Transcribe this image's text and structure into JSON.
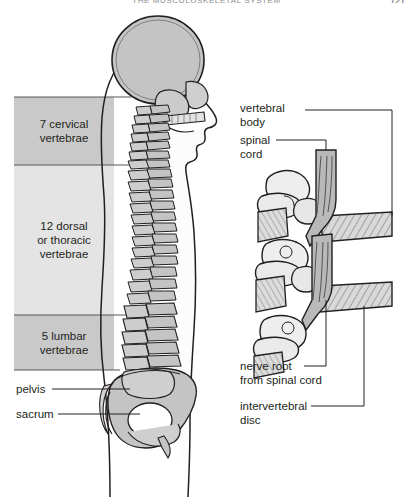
{
  "page": {
    "running_head": "THE MUSCULOSKELETAL SYSTEM",
    "folio": "121"
  },
  "figure": {
    "left_panel": {
      "name": "whole-spine-lateral",
      "regions": [
        {
          "id": "cervical",
          "label_line1": "7 cervical",
          "label_line2": "vertebrae",
          "fill": "#c9c9c9"
        },
        {
          "id": "thoracic",
          "label_line1": "12 dorsal",
          "label_line2": "or thoracic",
          "label_line3": "vertebrae",
          "fill": "#e4e4e4"
        },
        {
          "id": "lumbar",
          "label_line1": "5 lumbar",
          "label_line2": "vertebrae",
          "fill": "#c9c9c9"
        }
      ],
      "callouts": [
        {
          "id": "pelvis",
          "label": "pelvis"
        },
        {
          "id": "sacrum",
          "label": "sacrum"
        }
      ]
    },
    "right_panel": {
      "name": "vertebrae-detail",
      "callouts": [
        {
          "id": "vertebral-body",
          "line1": "vertebral",
          "line2": "body"
        },
        {
          "id": "spinal-cord",
          "line1": "spinal",
          "line2": "cord"
        },
        {
          "id": "nerve-root",
          "line1": "nerve root",
          "line2": "from spinal cord"
        },
        {
          "id": "intervertebral-disc",
          "line1": "intervertebral",
          "line2": "disc"
        }
      ]
    }
  },
  "colors": {
    "bone_fill": "#c4c4c4",
    "bone_light": "#dedede",
    "outline": "#231f20",
    "rule": "#55565a",
    "band_dark": "#c9c9c9",
    "band_light": "#e4e4e4"
  }
}
